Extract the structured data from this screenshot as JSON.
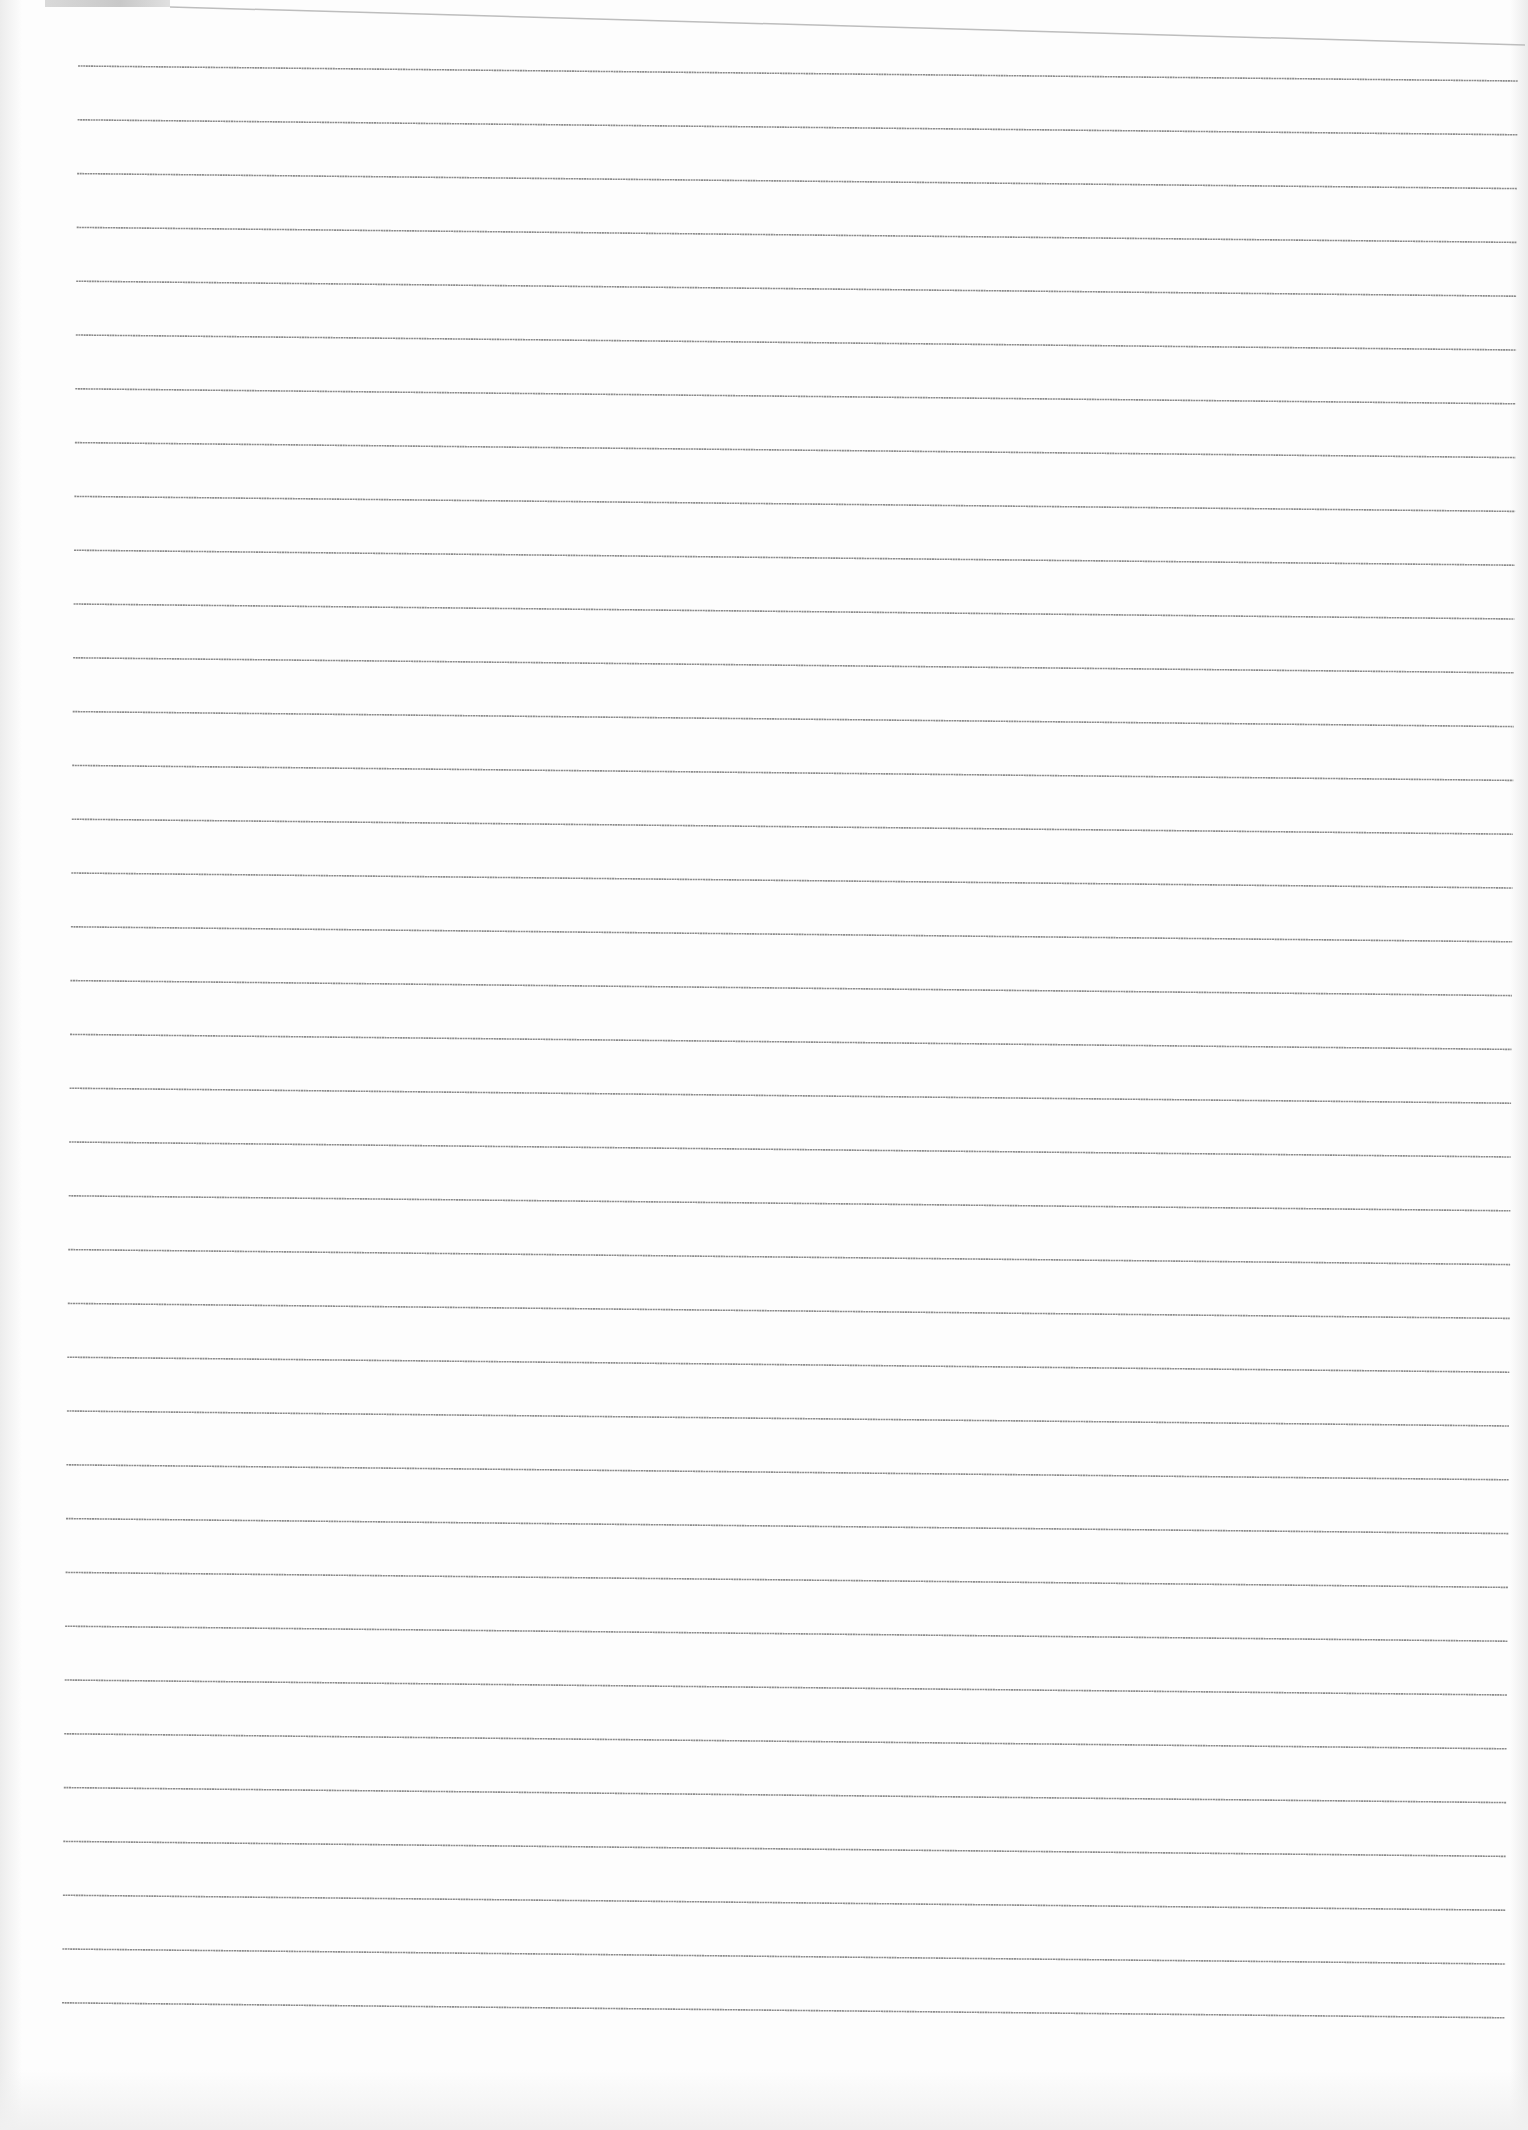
{
  "page": {
    "type": "blank ruled sheet",
    "background": "#fdfdfd",
    "line_color": "#8a8a8a",
    "top_edge_color": "#bdbdbd"
  },
  "top_edge": {
    "x1": 170,
    "y1": 7,
    "x2": 1525,
    "y2": 45
  },
  "ruled_lines": {
    "count": 37,
    "first_y_left": 66,
    "spacing": 53.8,
    "x_left_top": 78,
    "x_left_bottom": 62,
    "x_right_top": 1518,
    "x_right_bottom": 1505,
    "drop": 15
  }
}
